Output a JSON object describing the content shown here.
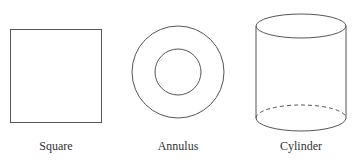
{
  "shapes": [
    {
      "name": "Square",
      "label": "Square"
    },
    {
      "name": "Annulus",
      "label": "Annulus"
    },
    {
      "name": "Cylinder",
      "label": "Cylinder"
    }
  ],
  "colors": {
    "stroke": "#555555",
    "background": "#ffffff"
  }
}
